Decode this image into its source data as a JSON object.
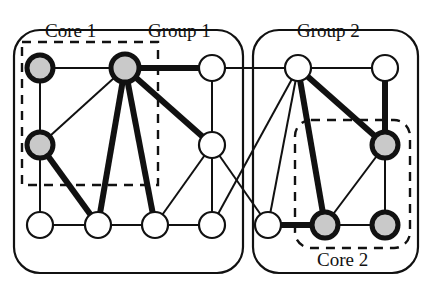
{
  "figure": {
    "kind": "node-link-diagram",
    "title_visible": false,
    "background": "#ffffff",
    "width": 431,
    "height": 288
  },
  "labels": {
    "core_1": "Core 1",
    "group_1": "Group 1",
    "group_2": "Group 2",
    "core_2": "Core 2"
  },
  "colors": {
    "stroke": "#111111",
    "node_fill_plain": "#ffffff",
    "node_fill_core": "#c9c9c9",
    "dashed_stroke": "#111111",
    "group_stroke": "#111111"
  },
  "groups": [
    {
      "id": "group-1",
      "label": "Group 1",
      "shape": "rounded-rect",
      "x": 14,
      "y": 30,
      "width": 229,
      "height": 243,
      "radius": 26,
      "stroke_width": 2.2
    },
    {
      "id": "group-2",
      "label": "Group 2",
      "shape": "rounded-rect",
      "x": 253,
      "y": 30,
      "width": 165,
      "height": 243,
      "radius": 26,
      "stroke_width": 2.2
    }
  ],
  "cores": [
    {
      "id": "core-1",
      "label": "Core 1",
      "shape": "dashed-rect",
      "x": 22,
      "y": 42,
      "width": 136,
      "height": 143,
      "stroke_width": 2.4,
      "dash": "9 7",
      "members": [
        "n1",
        "n2",
        "n6"
      ]
    },
    {
      "id": "core-2",
      "label": "Core 2",
      "shape": "dashed-rounded-rect",
      "x": 295,
      "y": 120,
      "width": 115,
      "height": 128,
      "radius": 16,
      "stroke_width": 2.4,
      "dash": "9 7",
      "members": [
        "n14",
        "n9",
        "n15"
      ]
    }
  ],
  "nodes": [
    {
      "id": "n1",
      "name": "node-top-1",
      "cx": 40,
      "cy": 68,
      "r": 13,
      "fill": "core",
      "ring": "thick",
      "row": "top",
      "group": "group-1",
      "core": "core-1"
    },
    {
      "id": "n2",
      "name": "node-top-2",
      "cx": 125,
      "cy": 68,
      "r": 14,
      "fill": "core",
      "ring": "thick",
      "row": "top",
      "group": "group-1",
      "core": "core-1"
    },
    {
      "id": "n3",
      "name": "node-top-3",
      "cx": 212,
      "cy": 68,
      "r": 13,
      "fill": "plain",
      "ring": "thin",
      "row": "top",
      "group": "group-1",
      "core": null
    },
    {
      "id": "n4",
      "name": "node-top-4",
      "cx": 298,
      "cy": 68,
      "r": 13,
      "fill": "plain",
      "ring": "thin",
      "row": "top",
      "group": "group-2",
      "core": null
    },
    {
      "id": "n5",
      "name": "node-top-5",
      "cx": 385,
      "cy": 68,
      "r": 13,
      "fill": "plain",
      "ring": "thin",
      "row": "top",
      "group": "group-2",
      "core": null
    },
    {
      "id": "n6",
      "name": "node-mid-left",
      "cx": 40,
      "cy": 145,
      "r": 13,
      "fill": "core",
      "ring": "thick",
      "row": "middle",
      "group": "group-1",
      "core": "core-1"
    },
    {
      "id": "n7",
      "name": "node-mid-center",
      "cx": 212,
      "cy": 145,
      "r": 13,
      "fill": "plain",
      "ring": "thin",
      "row": "middle",
      "group": "group-1",
      "core": null
    },
    {
      "id": "n8",
      "name": "node-mid-right",
      "cx": 385,
      "cy": 145,
      "r": 13,
      "fill": "core",
      "ring": "thick",
      "row": "middle",
      "group": "group-2",
      "core": "core-2"
    },
    {
      "id": "n9",
      "name": "node-bot-1",
      "cx": 40,
      "cy": 225,
      "r": 13,
      "fill": "plain",
      "ring": "thin",
      "row": "bottom",
      "group": "group-1",
      "core": null
    },
    {
      "id": "n10",
      "name": "node-bot-2",
      "cx": 98,
      "cy": 225,
      "r": 13,
      "fill": "plain",
      "ring": "thin",
      "row": "bottom",
      "group": "group-1",
      "core": null
    },
    {
      "id": "n11",
      "name": "node-bot-3",
      "cx": 155,
      "cy": 225,
      "r": 13,
      "fill": "plain",
      "ring": "thin",
      "row": "bottom",
      "group": "group-1",
      "core": null
    },
    {
      "id": "n12",
      "name": "node-bot-4",
      "cx": 212,
      "cy": 225,
      "r": 13,
      "fill": "plain",
      "ring": "thin",
      "row": "bottom",
      "group": "group-1",
      "core": null
    },
    {
      "id": "n13",
      "name": "node-bot-5",
      "cx": 268,
      "cy": 225,
      "r": 13,
      "fill": "plain",
      "ring": "thin",
      "row": "bottom",
      "group": "group-2",
      "core": null
    },
    {
      "id": "n14",
      "name": "node-bot-6",
      "cx": 325,
      "cy": 225,
      "r": 13,
      "fill": "core",
      "ring": "thick",
      "row": "bottom",
      "group": "group-2",
      "core": "core-2"
    },
    {
      "id": "n15",
      "name": "node-bot-7",
      "cx": 385,
      "cy": 225,
      "r": 13,
      "fill": "core",
      "ring": "thick",
      "row": "bottom",
      "group": "group-2",
      "core": "core-2"
    }
  ],
  "edges": [
    {
      "from": "n1",
      "to": "n2",
      "weight": "thin"
    },
    {
      "from": "n1",
      "to": "n6",
      "weight": "thin"
    },
    {
      "from": "n2",
      "to": "n3",
      "weight": "thick"
    },
    {
      "from": "n2",
      "to": "n6",
      "weight": "thin"
    },
    {
      "from": "n2",
      "to": "n7",
      "weight": "thick"
    },
    {
      "from": "n2",
      "to": "n10",
      "weight": "thick"
    },
    {
      "from": "n2",
      "to": "n11",
      "weight": "thick"
    },
    {
      "from": "n3",
      "to": "n4",
      "weight": "thin"
    },
    {
      "from": "n3",
      "to": "n7",
      "weight": "thin"
    },
    {
      "from": "n4",
      "to": "n5",
      "weight": "thin"
    },
    {
      "from": "n4",
      "to": "n8",
      "weight": "thick"
    },
    {
      "from": "n4",
      "to": "n14",
      "weight": "thick"
    },
    {
      "from": "n4",
      "to": "n13",
      "weight": "thin"
    },
    {
      "from": "n4",
      "to": "n12",
      "weight": "thin"
    },
    {
      "from": "n5",
      "to": "n8",
      "weight": "thick"
    },
    {
      "from": "n6",
      "to": "n9",
      "weight": "thin"
    },
    {
      "from": "n6",
      "to": "n10",
      "weight": "thick"
    },
    {
      "from": "n7",
      "to": "n11",
      "weight": "thin"
    },
    {
      "from": "n7",
      "to": "n12",
      "weight": "thin"
    },
    {
      "from": "n7",
      "to": "n13",
      "weight": "thin"
    },
    {
      "from": "n8",
      "to": "n14",
      "weight": "thin"
    },
    {
      "from": "n8",
      "to": "n15",
      "weight": "thin"
    },
    {
      "from": "n9",
      "to": "n10",
      "weight": "thin"
    },
    {
      "from": "n10",
      "to": "n11",
      "weight": "thin"
    },
    {
      "from": "n11",
      "to": "n12",
      "weight": "thin"
    },
    {
      "from": "n13",
      "to": "n14",
      "weight": "thick"
    },
    {
      "from": "n14",
      "to": "n15",
      "weight": "thin"
    }
  ],
  "stroke_widths": {
    "thin": 2.0,
    "thick": 6.0,
    "node_ring_thin": 2.2,
    "node_ring_thick": 5.0
  }
}
